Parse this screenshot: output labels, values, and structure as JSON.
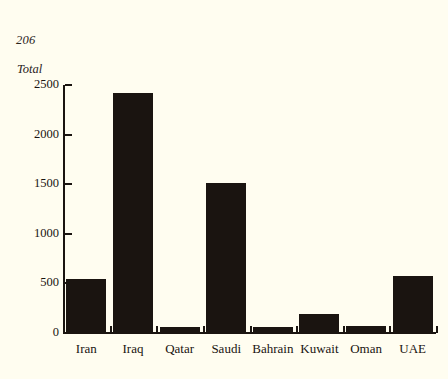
{
  "page": {
    "folio": "206"
  },
  "chart_data": {
    "type": "bar",
    "title": "",
    "subtitle": "",
    "xlabel": "",
    "ylabel": "Total",
    "categories": [
      "Iran",
      "Iraq",
      "Qatar",
      "Saudi",
      "Bahrain",
      "Kuwait",
      "Oman",
      "UAE"
    ],
    "values": [
      540,
      2420,
      60,
      1510,
      60,
      190,
      70,
      570
    ],
    "ylim": [
      0,
      2500
    ],
    "yticks": [
      0,
      500,
      1000,
      1500,
      2000,
      2500
    ],
    "ytick_labels": [
      "0",
      "500",
      "1000",
      "1500",
      "2000",
      "2500"
    ],
    "grid": false,
    "legend": null,
    "bar_color": "#1a1410",
    "background_color": "#fffdf0",
    "axis_color": "#1a1410"
  }
}
